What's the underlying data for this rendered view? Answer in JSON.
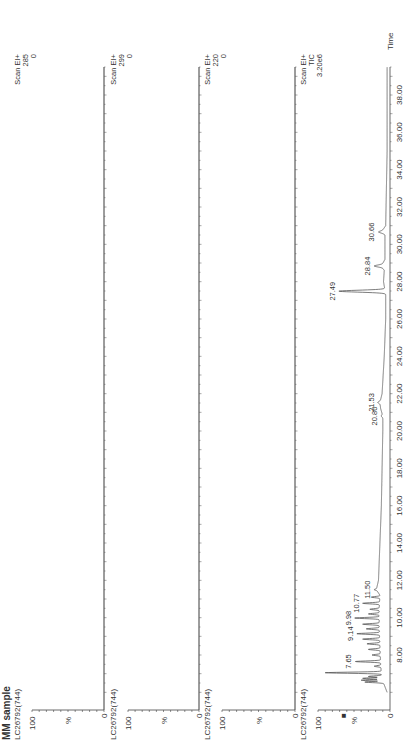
{
  "sample_title": "MM sample",
  "marker_glyph": "■",
  "chart_data": [
    {
      "type": "line",
      "trace_id": "LC26792(744)",
      "scan": "Scan EI+",
      "ion": "285",
      "max_intensity_label": "0",
      "ylabel": "%",
      "yticks": [
        "0",
        "100"
      ],
      "xlabel": "Time",
      "xlim": [
        6.0,
        39.5
      ],
      "ylim": [
        0,
        100
      ],
      "x": [],
      "y": [],
      "peak_labels": []
    },
    {
      "type": "line",
      "trace_id": "LC26792(744)",
      "scan": "Scan EI+",
      "ion": "299",
      "max_intensity_label": "0",
      "ylabel": "%",
      "yticks": [
        "0",
        "100"
      ],
      "xlabel": "Time",
      "xlim": [
        6.0,
        39.5
      ],
      "ylim": [
        0,
        100
      ],
      "x": [],
      "y": [],
      "peak_labels": []
    },
    {
      "type": "line",
      "trace_id": "LC26792(744)",
      "scan": "Scan EI+",
      "ion": "220",
      "max_intensity_label": "0",
      "ylabel": "%",
      "yticks": [
        "0",
        "100"
      ],
      "xlabel": "Time",
      "xlim": [
        6.0,
        39.5
      ],
      "ylim": [
        0,
        100
      ],
      "x": [],
      "y": [],
      "peak_labels": []
    },
    {
      "type": "line",
      "trace_id": "LC26792(744)",
      "scan": "Scan EI+",
      "ion": "TIC",
      "max_intensity_label": "3.20e6",
      "ylabel": "%",
      "yticks": [
        "0",
        "100"
      ],
      "xlabel": "Time",
      "xlim": [
        6.0,
        39.5
      ],
      "ylim": [
        0,
        100
      ],
      "xticks": [
        "8.00",
        "10.00",
        "12.00",
        "14.00",
        "16.00",
        "18.00",
        "20.00",
        "22.00",
        "24.00",
        "26.00",
        "28.00",
        "30.00",
        "32.00",
        "34.00",
        "36.00",
        "38.00"
      ],
      "xtick_values": [
        8,
        10,
        12,
        14,
        16,
        18,
        20,
        22,
        24,
        26,
        28,
        30,
        32,
        34,
        36,
        38
      ],
      "baseline": [
        [
          6.0,
          4
        ],
        [
          6.6,
          10
        ],
        [
          7.0,
          12
        ],
        [
          7.5,
          13
        ],
        [
          8.5,
          14
        ],
        [
          9.5,
          15
        ],
        [
          10.5,
          15
        ],
        [
          11.2,
          14
        ],
        [
          11.5,
          19
        ],
        [
          12.0,
          16
        ],
        [
          14.0,
          14
        ],
        [
          16.0,
          12
        ],
        [
          18.0,
          11
        ],
        [
          20.0,
          10
        ],
        [
          20.8,
          10
        ],
        [
          21.2,
          13
        ],
        [
          21.53,
          14
        ],
        [
          22.0,
          11
        ],
        [
          24.0,
          8
        ],
        [
          26.0,
          6
        ],
        [
          27.3,
          6
        ],
        [
          28.0,
          9
        ],
        [
          28.6,
          8
        ],
        [
          28.84,
          12
        ],
        [
          29.2,
          7
        ],
        [
          30.0,
          7
        ],
        [
          30.5,
          7
        ],
        [
          30.66,
          12
        ],
        [
          31.0,
          6
        ],
        [
          33.0,
          5
        ],
        [
          35.0,
          4
        ],
        [
          37.0,
          4
        ],
        [
          39.5,
          4
        ]
      ],
      "peaks": [
        {
          "t": 6.55,
          "h": 35
        },
        {
          "t": 6.65,
          "h": 40
        },
        {
          "t": 6.75,
          "h": 38
        },
        {
          "t": 6.85,
          "h": 30
        },
        {
          "t": 7.05,
          "h": 90
        },
        {
          "t": 7.4,
          "h": 22
        },
        {
          "t": 7.65,
          "h": 48
        },
        {
          "t": 8.0,
          "h": 25
        },
        {
          "t": 8.3,
          "h": 30
        },
        {
          "t": 8.6,
          "h": 32
        },
        {
          "t": 8.85,
          "h": 38
        },
        {
          "t": 9.14,
          "h": 46
        },
        {
          "t": 9.4,
          "h": 33
        },
        {
          "t": 9.65,
          "h": 38
        },
        {
          "t": 9.98,
          "h": 49
        },
        {
          "t": 10.2,
          "h": 30
        },
        {
          "t": 10.45,
          "h": 28
        },
        {
          "t": 10.77,
          "h": 38
        },
        {
          "t": 11.1,
          "h": 26
        },
        {
          "t": 11.5,
          "h": 22
        },
        {
          "t": 20.8,
          "h": 12
        },
        {
          "t": 21.53,
          "h": 17
        },
        {
          "t": 27.49,
          "h": 71
        },
        {
          "t": 28.84,
          "h": 22
        },
        {
          "t": 30.66,
          "h": 16
        }
      ],
      "peak_labels": [
        {
          "t": 7.65,
          "label": "7.65",
          "h": 48
        },
        {
          "t": 9.14,
          "label": "9.14",
          "h": 46
        },
        {
          "t": 9.98,
          "label": "9.98",
          "h": 49
        },
        {
          "t": 10.77,
          "label": "10.77",
          "h": 38
        },
        {
          "t": 11.5,
          "label": "11.50",
          "h": 22
        },
        {
          "t": 20.8,
          "label": "20.80",
          "h": 12
        },
        {
          "t": 21.53,
          "label": "21.53",
          "h": 17
        },
        {
          "t": 27.49,
          "label": "27.49",
          "h": 71
        },
        {
          "t": 28.84,
          "label": "28.84",
          "h": 22
        },
        {
          "t": 30.66,
          "label": "30.66",
          "h": 16
        }
      ]
    }
  ]
}
